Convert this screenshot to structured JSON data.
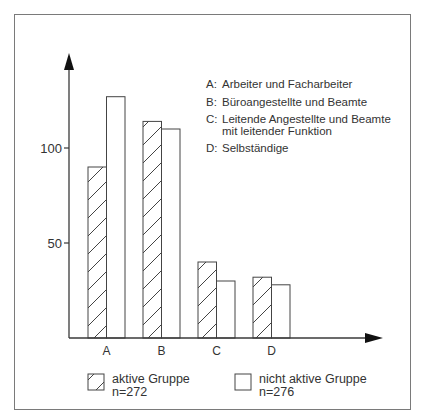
{
  "chart_data": {
    "type": "bar",
    "title": "",
    "xlabel": "",
    "ylabel": "",
    "categories": [
      "A",
      "B",
      "C",
      "D"
    ],
    "series": [
      {
        "name": "aktive Gruppe",
        "n_label": "n=272",
        "pattern": "hatched",
        "values": [
          90,
          114,
          40,
          32
        ]
      },
      {
        "name": "nicht aktive Gruppe",
        "n_label": "n=276",
        "pattern": "empty",
        "values": [
          127,
          110,
          30,
          28
        ]
      }
    ],
    "yticks": [
      50,
      100
    ],
    "ylim": [
      0,
      145
    ],
    "grid": false,
    "legend_position": "bottom",
    "category_descriptions": [
      {
        "key": "A:",
        "text": "Arbeiter und Facharbeiter"
      },
      {
        "key": "B:",
        "text": "Büroangestellte und Beamte"
      },
      {
        "key": "C:",
        "text": "Leitende Angestellte und Beamte",
        "text2": "mit leitender Funktion"
      },
      {
        "key": "D:",
        "text": "Selbständige"
      }
    ]
  },
  "legend": {
    "active": {
      "label": "aktive Gruppe",
      "n": "n=272"
    },
    "inactive": {
      "label": "nicht aktive Gruppe",
      "n": "n=276"
    }
  },
  "colors": {
    "line": "#3a3a3a",
    "frame": "#7a7a7a",
    "background": "#ffffff"
  }
}
